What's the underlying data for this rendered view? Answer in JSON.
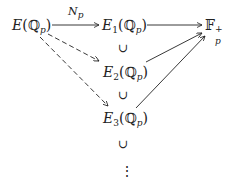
{
  "diagram": {
    "nodes": {
      "e": {
        "main": "E",
        "open": "(",
        "field": "ℚ",
        "field_sub": "p",
        "close": ")"
      },
      "e1": {
        "main": "E",
        "main_sub": "1",
        "open": "(",
        "field": "ℚ",
        "field_sub": "p",
        "close": ")"
      },
      "e2": {
        "main": "E",
        "main_sub": "2",
        "open": "(",
        "field": "ℚ",
        "field_sub": "p",
        "close": ")"
      },
      "e3": {
        "main": "E",
        "main_sub": "3",
        "open": "(",
        "field": "ℚ",
        "field_sub": "p",
        "close": ")"
      },
      "fp": {
        "main": "𝔽",
        "sub": "p",
        "sup": "+"
      }
    },
    "arrow_label": {
      "main": "N",
      "sub": "p"
    },
    "subset_symbol": "∪",
    "vdots": "⋮",
    "edges": [
      {
        "from": "E(Q_p)",
        "to": "E1(Q_p)",
        "style": "solid",
        "label": "N_p"
      },
      {
        "from": "E1(Q_p)",
        "to": "F_p^+",
        "style": "solid"
      },
      {
        "from": "E2(Q_p)",
        "to": "F_p^+",
        "style": "solid"
      },
      {
        "from": "E3(Q_p)",
        "to": "F_p^+",
        "style": "solid"
      },
      {
        "from": "E(Q_p)",
        "to": "E2(Q_p)",
        "style": "dashed"
      },
      {
        "from": "E(Q_p)",
        "to": "E3(Q_p)",
        "style": "dashed"
      }
    ]
  }
}
